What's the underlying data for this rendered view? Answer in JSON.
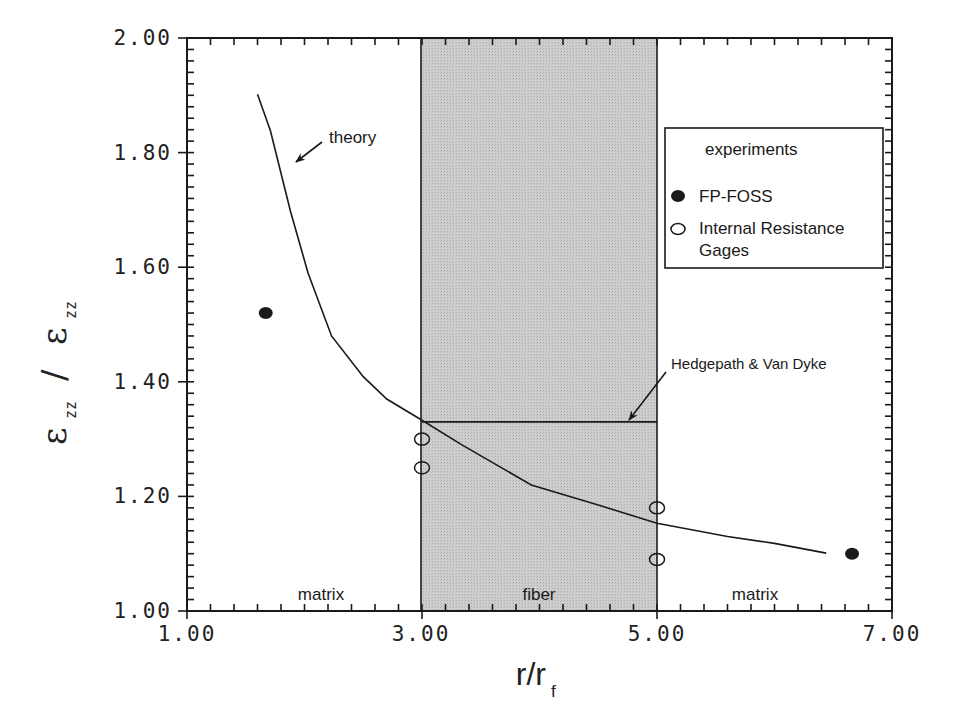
{
  "chart_data": {
    "type": "line",
    "title": "",
    "xlabel": "r/r_f",
    "xlabel_main": "r/r",
    "xlabel_sub": "f",
    "ylabel": "ε_zz / ε_zz",
    "ylabel_parts": {
      "num": "ε",
      "num_sub": "zz",
      "sep": "/",
      "den": "ε",
      "den_sub": "zz"
    },
    "xlim": [
      1.0,
      7.0
    ],
    "ylim": [
      1.0,
      2.0
    ],
    "x_ticks": [
      1.0,
      3.0,
      5.0,
      7.0
    ],
    "x_tick_labels": [
      "1.00",
      "3.00",
      "5.00",
      "7.00"
    ],
    "x_minor_step": 0.2,
    "y_ticks": [
      1.0,
      1.2,
      1.4,
      1.6,
      1.8,
      2.0
    ],
    "y_tick_labels": [
      "1.00",
      "1.20",
      "1.40",
      "1.60",
      "1.80",
      "2.00"
    ],
    "y_minor_step": 0.02,
    "grid": false,
    "regions": [
      {
        "label": "matrix",
        "x_range": [
          1.0,
          3.0
        ],
        "shaded": false
      },
      {
        "label": "fiber",
        "x_range": [
          3.0,
          5.0
        ],
        "shaded": true,
        "color": "#c8c8c8"
      },
      {
        "label": "matrix",
        "x_range": [
          5.0,
          7.0
        ],
        "shaded": false
      }
    ],
    "series": [
      {
        "name": "theory",
        "kind": "line",
        "x": [
          1.6,
          1.71,
          1.88,
          2.03,
          2.23,
          2.5,
          2.7,
          3.0,
          3.34,
          3.93,
          4.5,
          5.0,
          5.6,
          6.0,
          6.44
        ],
        "y": [
          1.902,
          1.838,
          1.698,
          1.59,
          1.48,
          1.409,
          1.37,
          1.333,
          1.29,
          1.22,
          1.185,
          1.153,
          1.13,
          1.118,
          1.101
        ]
      },
      {
        "name": "Hedgepath & Van Dyke",
        "kind": "line",
        "x": [
          3.0,
          5.0
        ],
        "y": [
          1.33,
          1.33
        ]
      },
      {
        "name": "FP-FOSS",
        "kind": "scatter",
        "marker": "filled-circle",
        "x": [
          1.67,
          6.66
        ],
        "y": [
          1.52,
          1.1
        ]
      },
      {
        "name": "Internal Resistance Gages",
        "kind": "scatter",
        "marker": "open-circle",
        "x": [
          3.0,
          3.0,
          5.0,
          5.0
        ],
        "y": [
          1.3,
          1.25,
          1.18,
          1.09
        ]
      }
    ],
    "annotations": [
      {
        "text": "theory",
        "arrow_to": [
          1.92,
          1.78
        ]
      },
      {
        "text": "Hedgepath & Van Dyke",
        "arrow_to": [
          4.65,
          1.33
        ]
      }
    ],
    "legend": {
      "title": "experiments",
      "position": "upper right",
      "entries": [
        {
          "label": "FP-FOSS",
          "marker": "filled-circle"
        },
        {
          "label": "Internal Resistance Gages",
          "label_lines": [
            "Internal Resistance",
            "Gages"
          ],
          "marker": "open-circle"
        }
      ]
    }
  },
  "regions": {
    "left": "matrix",
    "middle": "fiber",
    "right": "matrix"
  },
  "annotations": {
    "theory": "theory",
    "hedgepath": "Hedgepath & Van Dyke"
  },
  "legend": {
    "title": "experiments",
    "item1": "FP-FOSS",
    "item2_line1": "Internal Resistance",
    "item2_line2": "Gages"
  },
  "axes": {
    "x_labels": [
      "1.00",
      "3.00",
      "5.00",
      "7.00"
    ],
    "y_labels": [
      "1.00",
      "1.20",
      "1.40",
      "1.60",
      "1.80",
      "2.00"
    ],
    "xlabel_main": "r/r",
    "xlabel_sub": "f",
    "ylabel_eps": "ε",
    "ylabel_sub": "zz",
    "ylabel_sep": "/"
  }
}
